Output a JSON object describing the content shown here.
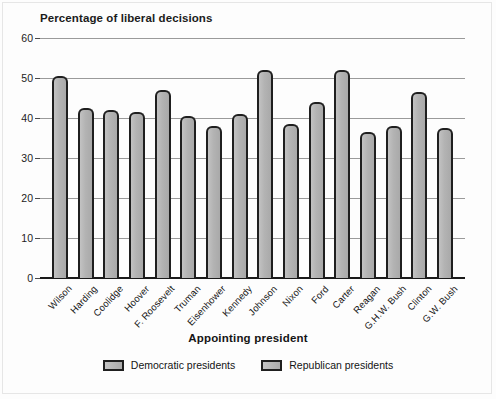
{
  "chart_data": {
    "type": "bar",
    "title": "Percentage of liberal decisions",
    "xlabel": "Appointing president",
    "ylabel": "",
    "ylim": [
      0,
      60
    ],
    "yticks": [
      0,
      10,
      20,
      30,
      40,
      50,
      60
    ],
    "grid": true,
    "legend_position": "bottom",
    "categories": [
      "Wilson",
      "Harding",
      "Coolidge",
      "Hoover",
      "F. Roosevelt",
      "Truman",
      "Eisenhower",
      "Kennedy",
      "Johnson",
      "Nixon",
      "Ford",
      "Carter",
      "Reagan",
      "G.H.W. Bush",
      "Clinton",
      "G.W. Bush"
    ],
    "values": [
      50.5,
      42.5,
      42,
      41.5,
      47,
      40.5,
      38,
      41,
      52,
      38.5,
      44,
      52,
      36.5,
      38,
      46.5,
      37.5
    ],
    "party": [
      "Democratic",
      "Republican",
      "Republican",
      "Republican",
      "Democratic",
      "Democratic",
      "Republican",
      "Democratic",
      "Democratic",
      "Republican",
      "Republican",
      "Democratic",
      "Republican",
      "Republican",
      "Democratic",
      "Republican"
    ],
    "legend": [
      {
        "label": "Democratic presidents",
        "color": "#b6b6b6"
      },
      {
        "label": "Republican presidents",
        "color": "#b6b6b6"
      }
    ],
    "colors": {
      "bar_fill": "#b6b6b6",
      "bar_outline": "#1f1f1f",
      "gridline": "#9a9a9a",
      "axis": "#1a1a1a",
      "text": "#151515",
      "background": "#fdfdfd"
    }
  }
}
